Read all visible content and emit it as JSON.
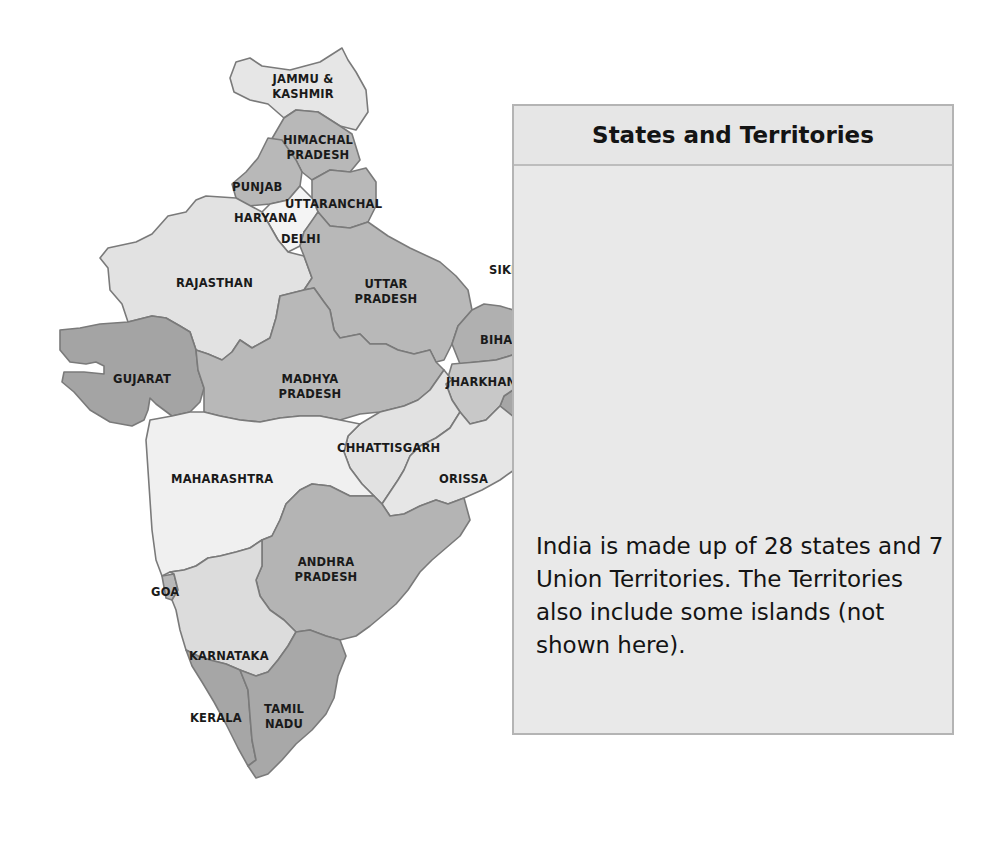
{
  "info_box": {
    "title": "States and Territories",
    "text": "India is made up of 28 states and 7 Union Territories. The Territories also include some islands (not shown here)."
  },
  "colors": {
    "dark_state": "#a3a3a3",
    "mid_state": "#b9b9b9",
    "light_state": "#e3e3e3",
    "white_state": "#f3f3f3",
    "border": "#7a7a7a",
    "box_fill": "#e9e9e9"
  },
  "labels": {
    "jammu_kashmir": "JAMMU & KASHMIR",
    "himachal_pradesh": "HIMACHAL PRADESH",
    "punjab": "PUNJAB",
    "uttaranchal": "UTTARANCHAL",
    "haryana": "HARYANA",
    "delhi": "DELHI",
    "rajasthan": "RAJASTHAN",
    "uttar_pradesh": "UTTAR PRADESH",
    "sikkim": "SIKKIM",
    "meghalaya": "MEGHALAYA",
    "arunachal_pradesh": "ARUNACHAL PRADESH",
    "assam": "ASSAM",
    "nagaland": "NAGALAND",
    "bihar": "BIHAR",
    "gujarat": "GUJARAT",
    "madhya_pradesh": "MADHYA PRADESH",
    "jharkhand": "JHARKHAND",
    "west_bengal": "WEST BENGAL",
    "manipur": "MANIPUR",
    "tripura": "TRIPURA",
    "mizoram": "MIZORAM",
    "chhattisgarh": "CHHATTISGARH",
    "maharashtra": "MAHARASHTRA",
    "orissa": "ORISSA",
    "andhra_pradesh": "ANDHRA PRADESH",
    "goa": "GOA",
    "karnataka": "KARNATAKA",
    "kerala": "KERALA",
    "tamil_nadu": "TAMIL NADU"
  }
}
